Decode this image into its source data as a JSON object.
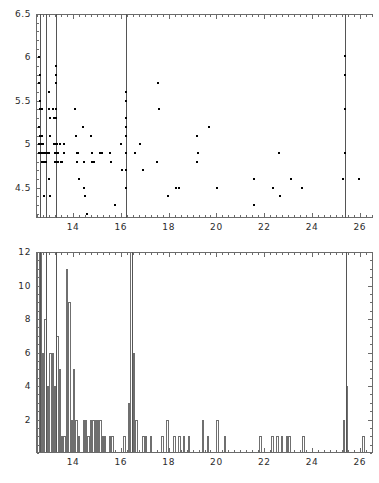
{
  "figure": {
    "title": "",
    "panel_count": 2
  },
  "chart_data": [
    {
      "type": "scatter",
      "title": "",
      "xlabel": "",
      "ylabel": "",
      "xlim": [
        12.45,
        26.55
      ],
      "ylim": [
        4.15,
        6.5
      ],
      "grid": false,
      "legend": null,
      "xticks": [
        14,
        16,
        18,
        20,
        22,
        24,
        26
      ],
      "xtick_labels": [
        "14",
        "16",
        "18",
        "20",
        "22",
        "24",
        "26"
      ],
      "yticks": [
        4.5,
        5,
        5.5,
        6,
        6.5
      ],
      "ytick_labels": [
        "4.5",
        "5",
        "5.5",
        "6",
        "6.5"
      ],
      "xminor_step": 0.25,
      "yminor_step": 0.1,
      "vertical_reference_lines": [
        12.62,
        12.86,
        13.27,
        16.2,
        25.36
      ],
      "marker": "square",
      "marker_size_px": 2,
      "marker_color": "#000000",
      "points": [
        [
          12.58,
          6.0
        ],
        [
          12.6,
          5.8
        ],
        [
          12.58,
          5.7
        ],
        [
          12.62,
          5.5
        ],
        [
          12.6,
          5.4
        ],
        [
          12.66,
          5.4
        ],
        [
          12.72,
          5.4
        ],
        [
          12.58,
          5.2
        ],
        [
          12.6,
          5.1
        ],
        [
          12.66,
          5.1
        ],
        [
          12.72,
          5.1
        ],
        [
          12.58,
          5.0
        ],
        [
          12.62,
          5.0
        ],
        [
          12.7,
          5.0
        ],
        [
          12.76,
          5.0
        ],
        [
          12.58,
          4.9
        ],
        [
          12.62,
          4.9
        ],
        [
          12.66,
          4.9
        ],
        [
          12.7,
          4.9
        ],
        [
          12.74,
          4.9
        ],
        [
          12.78,
          4.9
        ],
        [
          12.82,
          4.9
        ],
        [
          12.86,
          4.9
        ],
        [
          12.92,
          4.9
        ],
        [
          12.7,
          4.8
        ],
        [
          12.76,
          4.8
        ],
        [
          12.82,
          4.8
        ],
        [
          12.88,
          4.8
        ],
        [
          12.78,
          4.4
        ],
        [
          12.98,
          5.6
        ],
        [
          13.0,
          5.4
        ],
        [
          13.04,
          5.3
        ],
        [
          13.02,
          5.1
        ],
        [
          13.0,
          4.9
        ],
        [
          13.0,
          4.6
        ],
        [
          13.02,
          4.4
        ],
        [
          13.15,
          5.4
        ],
        [
          13.18,
          5.4
        ],
        [
          13.22,
          5.3
        ],
        [
          13.2,
          5.0
        ],
        [
          13.24,
          4.9
        ],
        [
          13.25,
          4.8
        ],
        [
          13.27,
          5.9
        ],
        [
          13.27,
          5.8
        ],
        [
          13.27,
          5.7
        ],
        [
          13.27,
          5.4
        ],
        [
          13.27,
          5.3
        ],
        [
          13.27,
          5.0
        ],
        [
          13.27,
          4.9
        ],
        [
          13.27,
          4.8
        ],
        [
          13.34,
          5.0
        ],
        [
          13.36,
          4.9
        ],
        [
          13.38,
          4.8
        ],
        [
          13.46,
          5.0
        ],
        [
          13.48,
          4.8
        ],
        [
          13.52,
          4.8
        ],
        [
          13.62,
          5.0
        ],
        [
          13.64,
          4.9
        ],
        [
          14.1,
          5.4
        ],
        [
          14.12,
          5.1
        ],
        [
          14.16,
          4.9
        ],
        [
          14.22,
          4.9
        ],
        [
          14.18,
          4.8
        ],
        [
          14.24,
          4.6
        ],
        [
          14.42,
          5.2
        ],
        [
          14.46,
          4.8
        ],
        [
          14.44,
          4.5
        ],
        [
          14.5,
          4.4
        ],
        [
          14.58,
          4.2
        ],
        [
          14.74,
          5.1
        ],
        [
          14.78,
          4.9
        ],
        [
          14.8,
          4.8
        ],
        [
          14.86,
          4.8
        ],
        [
          15.12,
          4.9
        ],
        [
          15.22,
          4.9
        ],
        [
          15.56,
          4.9
        ],
        [
          15.6,
          4.8
        ],
        [
          15.76,
          4.3
        ],
        [
          16.02,
          5.0
        ],
        [
          16.06,
          4.7
        ],
        [
          16.2,
          5.6
        ],
        [
          16.2,
          5.5
        ],
        [
          16.2,
          5.3
        ],
        [
          16.2,
          5.2
        ],
        [
          16.2,
          5.1
        ],
        [
          16.2,
          4.9
        ],
        [
          16.2,
          4.7
        ],
        [
          16.22,
          4.5
        ],
        [
          16.58,
          4.9
        ],
        [
          16.8,
          5.0
        ],
        [
          16.92,
          4.7
        ],
        [
          17.56,
          5.7
        ],
        [
          17.58,
          5.4
        ],
        [
          17.52,
          4.8
        ],
        [
          17.96,
          4.4
        ],
        [
          18.3,
          4.5
        ],
        [
          18.44,
          4.5
        ],
        [
          19.18,
          5.1
        ],
        [
          19.22,
          4.9
        ],
        [
          19.2,
          4.8
        ],
        [
          19.7,
          5.2
        ],
        [
          20.02,
          4.5
        ],
        [
          21.56,
          4.6
        ],
        [
          21.58,
          4.3
        ],
        [
          22.36,
          4.5
        ],
        [
          22.62,
          4.9
        ],
        [
          22.66,
          4.4
        ],
        [
          23.12,
          4.6
        ],
        [
          23.58,
          4.5
        ],
        [
          25.36,
          6.02
        ],
        [
          25.36,
          5.8
        ],
        [
          25.36,
          5.4
        ],
        [
          25.36,
          4.9
        ],
        [
          25.3,
          4.6
        ],
        [
          25.96,
          4.6
        ]
      ]
    },
    {
      "type": "bar",
      "subtype": "histogram",
      "title": "",
      "xlabel": "",
      "ylabel": "",
      "xlim": [
        12.45,
        26.55
      ],
      "ylim": [
        0,
        12
      ],
      "grid": false,
      "legend": null,
      "xticks": [
        14,
        16,
        18,
        20,
        22,
        24,
        26
      ],
      "xtick_labels": [
        "14",
        "16",
        "18",
        "20",
        "22",
        "24",
        "26"
      ],
      "yticks": [
        2,
        4,
        6,
        8,
        10,
        12
      ],
      "ytick_labels": [
        "2",
        "4",
        "6",
        "8",
        "10",
        "12"
      ],
      "xminor_step": 0.25,
      "yminor_step": 0.5,
      "bin_width": 0.1,
      "vertical_reference_lines": [
        12.62,
        12.86,
        13.27,
        16.45,
        25.42
      ],
      "bar_edge_color": "#6f6f6f",
      "bars": [
        [
          12.5,
          12
        ],
        [
          12.6,
          12
        ],
        [
          12.7,
          6
        ],
        [
          12.8,
          8
        ],
        [
          12.9,
          4
        ],
        [
          13.0,
          6
        ],
        [
          13.1,
          6
        ],
        [
          13.2,
          4
        ],
        [
          13.3,
          7
        ],
        [
          13.4,
          5
        ],
        [
          13.5,
          1
        ],
        [
          13.6,
          1
        ],
        [
          13.7,
          11
        ],
        [
          13.8,
          9
        ],
        [
          13.9,
          2
        ],
        [
          14.0,
          5
        ],
        [
          14.1,
          2
        ],
        [
          14.2,
          1
        ],
        [
          14.4,
          2
        ],
        [
          14.5,
          2
        ],
        [
          14.6,
          1
        ],
        [
          14.7,
          2
        ],
        [
          14.8,
          2
        ],
        [
          14.9,
          2
        ],
        [
          15.0,
          2
        ],
        [
          15.1,
          2
        ],
        [
          15.2,
          1
        ],
        [
          15.3,
          1
        ],
        [
          15.5,
          1
        ],
        [
          15.6,
          1
        ],
        [
          16.1,
          1
        ],
        [
          16.3,
          3
        ],
        [
          16.4,
          12
        ],
        [
          16.5,
          6
        ],
        [
          16.6,
          2
        ],
        [
          16.9,
          1
        ],
        [
          17.0,
          1
        ],
        [
          17.2,
          1
        ],
        [
          17.7,
          1
        ],
        [
          17.9,
          2
        ],
        [
          18.2,
          1
        ],
        [
          18.4,
          1
        ],
        [
          18.6,
          1
        ],
        [
          18.8,
          1
        ],
        [
          19.4,
          2
        ],
        [
          19.6,
          1
        ],
        [
          20.0,
          2
        ],
        [
          20.3,
          1
        ],
        [
          21.8,
          1
        ],
        [
          22.3,
          1
        ],
        [
          22.5,
          1
        ],
        [
          22.7,
          1
        ],
        [
          22.9,
          1
        ],
        [
          23.0,
          1
        ],
        [
          23.6,
          1
        ],
        [
          25.3,
          2
        ],
        [
          25.4,
          4
        ],
        [
          26.1,
          1
        ]
      ]
    }
  ]
}
